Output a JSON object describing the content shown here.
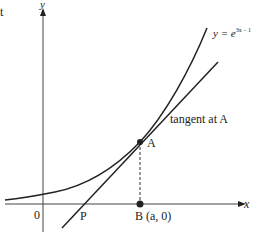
{
  "corner_text": "t",
  "axes": {
    "x_label": "x",
    "y_label": "y",
    "origin_label": "0"
  },
  "curve": {
    "label_prefix": "y = e",
    "label_exponent": "3x − 1"
  },
  "tangent": {
    "label": "tangent at A"
  },
  "points": {
    "A": {
      "label": "A"
    },
    "P": {
      "label": "P"
    },
    "B": {
      "label": "B (a, 0)"
    }
  },
  "colors": {
    "line": "#222222",
    "background": "#ffffff"
  }
}
